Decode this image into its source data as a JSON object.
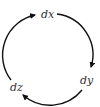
{
  "diagram": {
    "type": "cycle",
    "nodes": [
      {
        "id": "dx",
        "label": "dx",
        "x": 47,
        "y": 17
      },
      {
        "id": "dy",
        "label": "dy",
        "x": 86,
        "y": 83
      },
      {
        "id": "dz",
        "label": "dz",
        "x": 16,
        "y": 89
      }
    ],
    "edges": [
      {
        "from": "dx",
        "to": "dy",
        "direction": "clockwise"
      },
      {
        "from": "dy",
        "to": "dz",
        "direction": "clockwise"
      },
      {
        "from": "dz",
        "to": "dx",
        "direction": "clockwise"
      }
    ],
    "colors": {
      "stroke": "#111111",
      "text": "#333333"
    }
  }
}
